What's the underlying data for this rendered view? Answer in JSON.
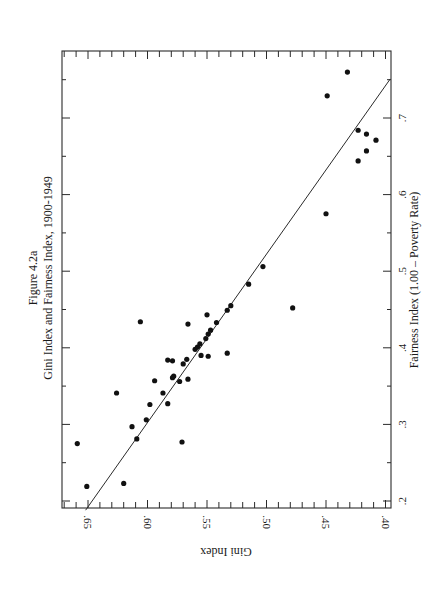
{
  "figure": {
    "label": "Figure 4.2a",
    "title": "Gini Index and Fairness Index, 1900-1949"
  },
  "chart_data": {
    "type": "scatter",
    "orientation": "rotated 90° clockwise on page (Gini Index runs along bottom edge reversed; Fairness Index along right edge)",
    "xlabel": "Fairness Index (1.00 – Poverty Rate)",
    "ylabel": "Gini Index",
    "x_ticks": [
      ".2",
      ".3",
      ".4",
      ".5",
      ".6",
      ".7"
    ],
    "y_ticks": [
      ".65",
      ".60",
      ".55",
      ".50",
      ".45",
      ".40"
    ],
    "xlim": [
      0.19,
      0.78
    ],
    "ylim": [
      0.397,
      0.671
    ],
    "grid": false,
    "legend": null,
    "fit_line": {
      "type": "linear regression",
      "from": {
        "fairness": 0.188,
        "gini": 0.652
      },
      "to": {
        "fairness": 0.751,
        "gini": 0.396
      }
    },
    "points": [
      {
        "fairness": 0.275,
        "gini": 0.659
      },
      {
        "fairness": 0.219,
        "gini": 0.651
      },
      {
        "fairness": 0.223,
        "gini": 0.62
      },
      {
        "fairness": 0.341,
        "gini": 0.626
      },
      {
        "fairness": 0.434,
        "gini": 0.606
      },
      {
        "fairness": 0.297,
        "gini": 0.613
      },
      {
        "fairness": 0.281,
        "gini": 0.609
      },
      {
        "fairness": 0.306,
        "gini": 0.601
      },
      {
        "fairness": 0.326,
        "gini": 0.598
      },
      {
        "fairness": 0.357,
        "gini": 0.594
      },
      {
        "fairness": 0.341,
        "gini": 0.587
      },
      {
        "fairness": 0.327,
        "gini": 0.583
      },
      {
        "fairness": 0.384,
        "gini": 0.583
      },
      {
        "fairness": 0.383,
        "gini": 0.579
      },
      {
        "fairness": 0.361,
        "gini": 0.579
      },
      {
        "fairness": 0.363,
        "gini": 0.578
      },
      {
        "fairness": 0.356,
        "gini": 0.573
      },
      {
        "fairness": 0.277,
        "gini": 0.571
      },
      {
        "fairness": 0.379,
        "gini": 0.57
      },
      {
        "fairness": 0.385,
        "gini": 0.567
      },
      {
        "fairness": 0.359,
        "gini": 0.566
      },
      {
        "fairness": 0.431,
        "gini": 0.566
      },
      {
        "fairness": 0.398,
        "gini": 0.56
      },
      {
        "fairness": 0.401,
        "gini": 0.558
      },
      {
        "fairness": 0.405,
        "gini": 0.556
      },
      {
        "fairness": 0.39,
        "gini": 0.555
      },
      {
        "fairness": 0.443,
        "gini": 0.55
      },
      {
        "fairness": 0.412,
        "gini": 0.551
      },
      {
        "fairness": 0.418,
        "gini": 0.549
      },
      {
        "fairness": 0.423,
        "gini": 0.547
      },
      {
        "fairness": 0.389,
        "gini": 0.549
      },
      {
        "fairness": 0.433,
        "gini": 0.542
      },
      {
        "fairness": 0.449,
        "gini": 0.533
      },
      {
        "fairness": 0.393,
        "gini": 0.533
      },
      {
        "fairness": 0.455,
        "gini": 0.53
      },
      {
        "fairness": 0.483,
        "gini": 0.515
      },
      {
        "fairness": 0.506,
        "gini": 0.503
      },
      {
        "fairness": 0.452,
        "gini": 0.478
      },
      {
        "fairness": 0.575,
        "gini": 0.45
      },
      {
        "fairness": 0.729,
        "gini": 0.449
      },
      {
        "fairness": 0.76,
        "gini": 0.432
      },
      {
        "fairness": 0.684,
        "gini": 0.423
      },
      {
        "fairness": 0.679,
        "gini": 0.416
      },
      {
        "fairness": 0.671,
        "gini": 0.408
      },
      {
        "fairness": 0.657,
        "gini": 0.416
      },
      {
        "fairness": 0.644,
        "gini": 0.423
      }
    ]
  },
  "layout": {
    "frame": {
      "left": 62,
      "top": 51,
      "right": 391,
      "bottom": 508
    },
    "gini_to_px": {
      "ref_value": 0.65,
      "ref_px": 88,
      "px_per_unit": 1190
    },
    "fairness_to_px": {
      "ref_value": 0.2,
      "ref_px": 501,
      "px_per_unit": 766
    },
    "point_radius": 2.6,
    "gini_tick_step": 0.01,
    "fairness_tick_step": 0.05
  }
}
